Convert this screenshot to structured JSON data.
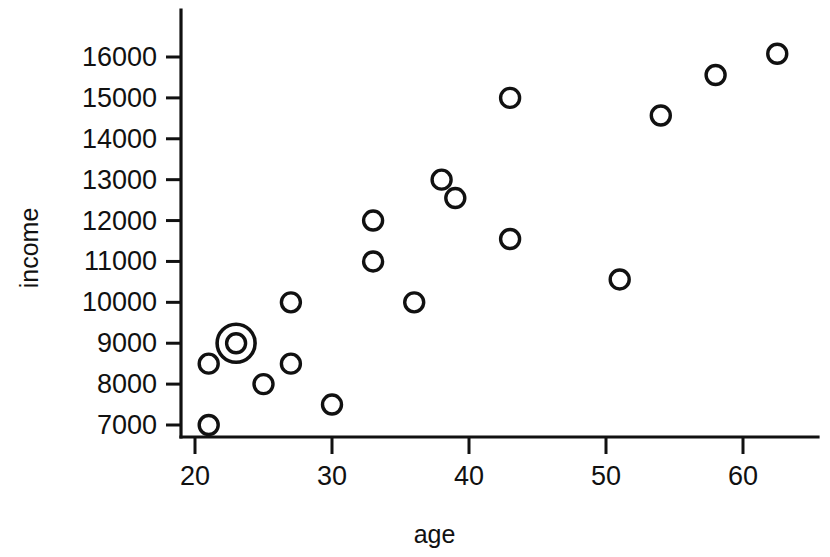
{
  "chart_data": {
    "type": "scatter",
    "title": "",
    "xlabel": "age",
    "ylabel": "income",
    "xlim": [
      19.0,
      65.5
    ],
    "ylim": [
      6700,
      16400
    ],
    "grid": false,
    "legend": null,
    "x_ticks": [
      20,
      30,
      40,
      50,
      60
    ],
    "x_tick_labels": [
      "20",
      "30",
      "40",
      "50",
      "60"
    ],
    "y_ticks": [
      7000,
      8000,
      9000,
      10000,
      11000,
      12000,
      13000,
      14000,
      15000,
      16000
    ],
    "y_tick_labels": [
      "7000",
      "8000",
      "9000",
      "10000",
      "11000",
      "12000",
      "13000",
      "14000",
      "15000",
      "16000"
    ],
    "marker": "open-circle",
    "points": [
      {
        "x": 21,
        "y": 8500,
        "highlighted": false
      },
      {
        "x": 21,
        "y": 7000,
        "highlighted": false
      },
      {
        "x": 23,
        "y": 9000,
        "highlighted": true
      },
      {
        "x": 25,
        "y": 8000,
        "highlighted": false
      },
      {
        "x": 27,
        "y": 10000,
        "highlighted": false
      },
      {
        "x": 27,
        "y": 8500,
        "highlighted": false
      },
      {
        "x": 30,
        "y": 7500,
        "highlighted": false
      },
      {
        "x": 33,
        "y": 12000,
        "highlighted": false
      },
      {
        "x": 33,
        "y": 11000,
        "highlighted": false
      },
      {
        "x": 36,
        "y": 10000,
        "highlighted": false
      },
      {
        "x": 38,
        "y": 13000,
        "highlighted": false
      },
      {
        "x": 39,
        "y": 12550,
        "highlighted": false
      },
      {
        "x": 43,
        "y": 15000,
        "highlighted": false
      },
      {
        "x": 43,
        "y": 11550,
        "highlighted": false
      },
      {
        "x": 51,
        "y": 10560,
        "highlighted": false
      },
      {
        "x": 54,
        "y": 14570,
        "highlighted": false
      },
      {
        "x": 58,
        "y": 15560,
        "highlighted": false
      },
      {
        "x": 62.5,
        "y": 16080,
        "highlighted": false
      }
    ],
    "colors": {
      "marker_stroke": "#111111",
      "axis": "#111111",
      "background": "#ffffff"
    }
  }
}
